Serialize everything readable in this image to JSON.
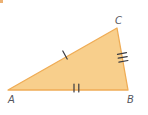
{
  "figure": {
    "type": "geometry-triangle-diagram",
    "background_color": "#ffffff",
    "triangle": {
      "points": "8,90 117,28 128,90",
      "fill": "#F8CF8C",
      "stroke": "#EFAC55"
    },
    "vertices": [
      {
        "label": "A",
        "x": 11.5,
        "y": 103
      },
      {
        "label": "B",
        "x": 130.5,
        "y": 103
      },
      {
        "label": "C",
        "x": 118.5,
        "y": 24
      }
    ],
    "label_color": "#54555C",
    "tick_color": "#3A3A40",
    "tick_counts": {
      "side_AC": 1,
      "side_AB": 2,
      "side_BC": 3
    },
    "ticks": {
      "ac": [
        {
          "x1": 62.8,
          "y1": 51.0,
          "x2": 67.2,
          "y2": 59.0
        }
      ],
      "ab": [
        {
          "x1": 74.0,
          "y1": 84.0,
          "x2": 74.0,
          "y2": 92.0
        },
        {
          "x1": 78.8,
          "y1": 84.0,
          "x2": 78.8,
          "y2": 92.0
        }
      ],
      "bc": [
        {
          "x1": 117.5,
          "y1": 54.3,
          "x2": 126.5,
          "y2": 52.7
        },
        {
          "x1": 118.2,
          "y1": 58.2,
          "x2": 127.2,
          "y2": 56.6
        },
        {
          "x1": 118.9,
          "y1": 62.1,
          "x2": 127.9,
          "y2": 60.5
        }
      ]
    },
    "artifact_color": "#E9A35B"
  }
}
